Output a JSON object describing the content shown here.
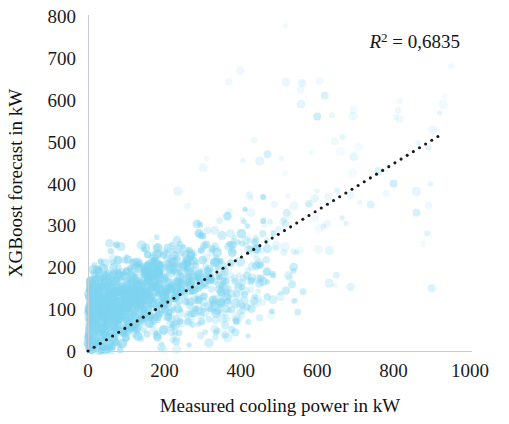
{
  "chart_data": {
    "type": "scatter",
    "title": "",
    "xlabel": "Measured cooling power in kW",
    "ylabel": "XGBoost forecast in kW",
    "xlim": [
      0,
      1000
    ],
    "ylim": [
      0,
      800
    ],
    "xticks": [
      0,
      200,
      400,
      600,
      800,
      1000
    ],
    "yticks": [
      0,
      100,
      200,
      300,
      400,
      500,
      600,
      700,
      800
    ],
    "xtick_labels": [
      "0",
      "200",
      "400",
      "600",
      "800",
      "1000"
    ],
    "ytick_labels": [
      "0",
      "100",
      "200",
      "300",
      "400",
      "500",
      "600",
      "700",
      "800"
    ],
    "grid": false,
    "legend": null,
    "annotations": [
      {
        "name": "r-squared",
        "text": "R² = 0,6835",
        "value": 0.6835,
        "symbol": "R",
        "superscript": "2",
        "equals": "=",
        "number": "0,6835",
        "x": 820,
        "y": 745
      }
    ],
    "marker": {
      "color": "#7ed4f0",
      "edge_color": "#69cbee",
      "opacity": 0.45,
      "size": 7,
      "shape": "circle"
    },
    "trendline": {
      "name": "identity-reference-line",
      "style": "dotted",
      "color": "#1a1a1a",
      "dot_size": 3.1,
      "x_start": 0,
      "y_start": 0,
      "x_end": 930,
      "y_end": 520,
      "slope": 0.559,
      "intercept": 0
    },
    "series": [
      {
        "name": "XGBoost forecast vs measured cooling power",
        "color": "#7ed4f0",
        "n_points": 1400,
        "description": "Dense low-range cluster 0-500 kW measured with forecasts 0-350 kW, thinning toward higher measured powers; sparse faint outliers up to 900 kW measured and 700 kW forecast.",
        "clusters": [
          {
            "name": "core-dense-cloud",
            "count": 560,
            "x_center": 110,
            "y_center": 125,
            "x_spread": 72,
            "y_spread": 52,
            "opacity": 0.5
          },
          {
            "name": "low-left-column",
            "count": 260,
            "x_center": 35,
            "y_center": 105,
            "x_spread": 30,
            "y_spread": 60,
            "opacity": 0.5
          },
          {
            "name": "mid-diagonal-band",
            "count": 300,
            "x_center": 260,
            "y_center": 185,
            "x_spread": 95,
            "y_spread": 60,
            "opacity": 0.42
          },
          {
            "name": "lower-mid-spread",
            "count": 170,
            "x_center": 330,
            "y_center": 105,
            "x_spread": 110,
            "y_spread": 45,
            "opacity": 0.35
          },
          {
            "name": "upper-sparse-tail",
            "count": 70,
            "x_center": 560,
            "y_center": 330,
            "x_spread": 180,
            "y_spread": 120,
            "opacity": 0.2
          },
          {
            "name": "faint-high-outliers",
            "count": 40,
            "x_center": 700,
            "y_center": 520,
            "x_spread": 220,
            "y_spread": 150,
            "opacity": 0.13
          }
        ],
        "notable_points": [
          {
            "x": 560,
            "y": 640
          },
          {
            "x": 620,
            "y": 610
          },
          {
            "x": 600,
            "y": 560
          },
          {
            "x": 760,
            "y": 430
          },
          {
            "x": 800,
            "y": 400
          },
          {
            "x": 740,
            "y": 350
          },
          {
            "x": 860,
            "y": 330
          },
          {
            "x": 900,
            "y": 150
          },
          {
            "x": 520,
            "y": 330
          },
          {
            "x": 470,
            "y": 470
          }
        ]
      }
    ]
  },
  "axes": {
    "x_axis_name": "x-axis",
    "y_axis_name": "y-axis"
  }
}
